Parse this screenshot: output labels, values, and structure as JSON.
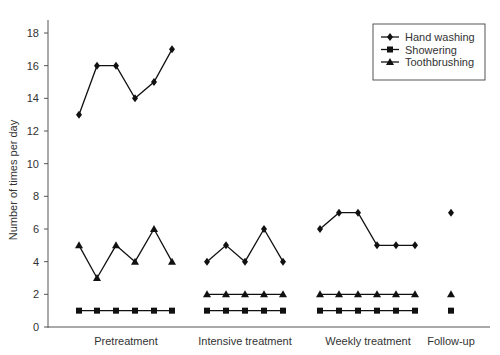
{
  "chart_data": {
    "type": "line",
    "title": "",
    "xlabel": "",
    "ylabel": "Number of times per day",
    "ylim": [
      0,
      18
    ],
    "yticks": [
      0,
      2,
      4,
      6,
      8,
      10,
      12,
      14,
      16,
      18
    ],
    "grid": false,
    "legend_position": "top-right",
    "phases": [
      {
        "label": "Pretreatment",
        "sessions": 6
      },
      {
        "label": "Intensive treatment",
        "sessions": 5
      },
      {
        "label": "Weekly treatment",
        "sessions": 6
      },
      {
        "label": "Follow-up",
        "sessions": 1
      }
    ],
    "series": [
      {
        "name": "Hand washing",
        "marker": "diamond",
        "phases": [
          [
            13,
            16,
            16,
            14,
            15,
            17
          ],
          [
            4,
            5,
            4,
            6,
            4
          ],
          [
            6,
            7,
            7,
            5,
            5,
            5
          ],
          [
            7
          ]
        ]
      },
      {
        "name": "Showering",
        "marker": "square",
        "phases": [
          [
            1,
            1,
            1,
            1,
            1,
            1
          ],
          [
            1,
            1,
            1,
            1,
            1
          ],
          [
            1,
            1,
            1,
            1,
            1,
            1
          ],
          [
            1
          ]
        ]
      },
      {
        "name": "Toothbrushing",
        "marker": "triangle",
        "phases": [
          [
            5,
            3,
            5,
            4,
            6,
            4
          ],
          [
            2,
            2,
            2,
            2,
            2
          ],
          [
            2,
            2,
            2,
            2,
            2,
            2
          ],
          [
            2
          ]
        ]
      }
    ]
  }
}
